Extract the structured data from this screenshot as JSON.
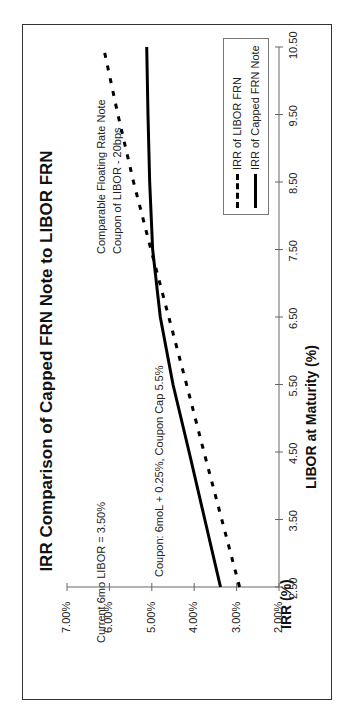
{
  "chart_data": {
    "type": "line",
    "title": "IRR Comparison of Capped FRN Note to LIBOR FRN",
    "xlabel": "LIBOR at Maturity (%)",
    "ylabel": "IRR (%)",
    "x_ticks": [
      "2.50",
      "3.50",
      "4.50",
      "5.50",
      "6.50",
      "7.50",
      "8.50",
      "9.50",
      "10.50"
    ],
    "y_ticks": [
      "2.00%",
      "3.00%",
      "4.00%",
      "5.00%",
      "6.00%",
      "7.00%"
    ],
    "xlim": [
      2.5,
      10.5
    ],
    "ylim": [
      2.0,
      7.0
    ],
    "grid": false,
    "legend_position": "lower right",
    "orientation": "rotated 90° counter-clockwise on page",
    "x": [
      2.5,
      3.5,
      4.5,
      5.5,
      6.5,
      7.5,
      8.5,
      9.5,
      10.5
    ],
    "series": [
      {
        "name": "IRR of LIBOR FRN",
        "style": "dashed",
        "values": [
          2.93,
          3.35,
          3.77,
          4.18,
          4.6,
          5.02,
          5.43,
          5.8,
          6.14
        ]
      },
      {
        "name": "IRR of Capped FRN Note",
        "style": "solid",
        "values": [
          3.38,
          3.75,
          4.12,
          4.5,
          4.8,
          4.98,
          5.05,
          5.09,
          5.12
        ]
      }
    ],
    "annotations": [
      "Current 6mo LIBOR = 3.50%",
      "Coupon: 6moL + 0.25%, Coupon Cap 5.5%",
      "Comparable Floating Rate Note",
      "Coupon of LIBOR - 20bps"
    ]
  }
}
